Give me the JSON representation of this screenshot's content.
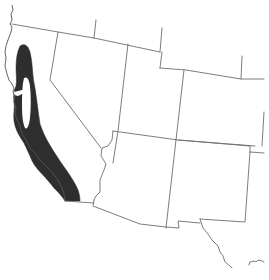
{
  "map": {
    "type": "species-range-map",
    "region": "Western United States",
    "states_shown": [
      "California",
      "Oregon (south edge)",
      "Nevada",
      "Utah",
      "Arizona",
      "Idaho (south edge)",
      "Wyoming (south edge)",
      "Colorado",
      "New Mexico",
      "Texas (west edge)"
    ],
    "legend": {
      "range_label": "Range",
      "range_color": "#2e2e2e",
      "border_color": "#6e6e6e",
      "background_color": "#ffffff"
    },
    "range_description": "Coastal and foothill California, from northern California south to the Mexican border, surrounding the Central Valley"
  }
}
